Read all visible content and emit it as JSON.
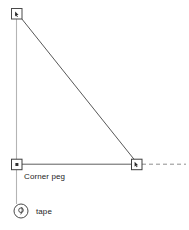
{
  "diagram": {
    "background_color": "#ffffff",
    "labels": {
      "corner_peg": "Corner peg",
      "tape": "tape"
    },
    "icons": {
      "tape_reel": "tape-measure-icon",
      "peg_top": "peg-square-icon",
      "peg_corner": "peg-square-icon",
      "peg_right": "peg-square-icon"
    },
    "colors": {
      "line_dark": "#4a4a4a",
      "line_light": "#b0b0b0",
      "line_medium": "#6e6e6e",
      "text": "#1d1d1d",
      "dashed": "#8a8a8a"
    },
    "elements": {
      "peg_top": {
        "x": 11,
        "y": 8,
        "size": 11
      },
      "peg_corner": {
        "x": 11,
        "y": 159,
        "size": 11
      },
      "peg_right": {
        "x": 131,
        "y": 159,
        "size": 11
      },
      "vertical_line": {
        "x": 16,
        "y1": 14,
        "y2": 203
      },
      "diagonal_line": {
        "x1": 18,
        "y1": 14,
        "x2": 137,
        "y2": 163
      },
      "horizontal_line": {
        "y": 164,
        "x1": 17,
        "x2": 132
      },
      "dashed_line": {
        "y": 164,
        "x1": 142,
        "x2": 186
      },
      "tape_circle": {
        "cx": 21,
        "cy": 211,
        "r": 7
      },
      "tape_inner": {
        "cx": 21,
        "cy": 211,
        "r": 2.4
      }
    }
  }
}
